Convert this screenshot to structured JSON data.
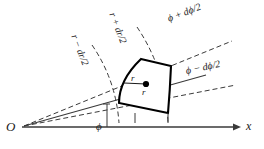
{
  "figure": {
    "kind": "polar-area-element-diagram",
    "background_color": "#ffffff",
    "line_color": "#1a1a1a",
    "cell_stroke_color": "#000000",
    "dashed_color": "#4a4a4a"
  },
  "labels": {
    "origin": "O",
    "x_axis": "x",
    "angle": "ϕ",
    "radius_center": "r",
    "point_radius": "r",
    "phi_plus": "ϕ + dϕ/2",
    "phi_minus": "ϕ − dϕ/2",
    "r_plus": "r + dr/2",
    "r_minus": "r − dr/2"
  },
  "geometry": {
    "origin_point": [
      22,
      127
    ],
    "x_axis_end": [
      238,
      127
    ],
    "phi_ray_end": [
      205,
      76
    ],
    "phi_plus_ray_end": [
      232,
      42
    ],
    "phi_minus_ray_end": [
      236,
      86
    ],
    "cell_corners": {
      "inner_lower": [
        119,
        103
      ],
      "inner_upper": [
        141,
        59
      ],
      "outer_upper": [
        171,
        66
      ],
      "outer_lower": [
        168,
        113
      ]
    },
    "center_dot": [
      146,
      84
    ],
    "tick_marks_x": [
      135,
      168
    ],
    "angle_tick_x": 107
  }
}
